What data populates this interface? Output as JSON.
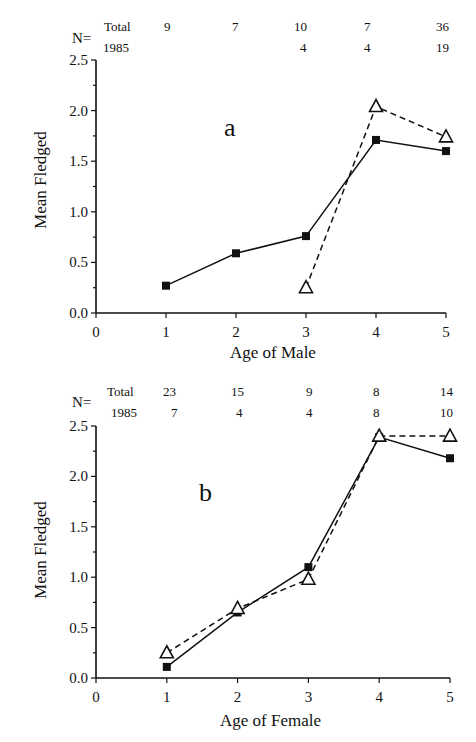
{
  "header": {
    "left_fragment": "",
    "center_fragment": "",
    "right_fragment": ""
  },
  "panels": [
    {
      "letter": "a",
      "n_table": {
        "label": "N=",
        "rows": [
          {
            "label": "Total",
            "values": [
              "9",
              "7",
              "10",
              "7",
              "36"
            ]
          },
          {
            "label": "1985",
            "values": [
              "",
              "",
              "4",
              "4",
              "19"
            ]
          }
        ]
      },
      "ylabel": "Mean Fledged",
      "xlabel": "Age of Male",
      "yticks": [
        "0.0",
        "0.5",
        "1.0",
        "1.5",
        "2.0",
        "2.5"
      ],
      "xticks": [
        "0",
        "1",
        "2",
        "3",
        "4",
        "5"
      ]
    },
    {
      "letter": "b",
      "n_table": {
        "label": "N=",
        "rows": [
          {
            "label": "Total",
            "values": [
              "23",
              "15",
              "9",
              "8",
              "14"
            ]
          },
          {
            "label": "1985",
            "values": [
              "7",
              "4",
              "4",
              "8",
              "10"
            ]
          }
        ]
      },
      "ylabel": "Mean Fledged",
      "xlabel": "Age of Female",
      "yticks": [
        "0.0",
        "0.5",
        "1.0",
        "1.5",
        "2.0",
        "2.5"
      ],
      "xticks": [
        "0",
        "1",
        "2",
        "3",
        "4",
        "5"
      ]
    }
  ],
  "chart_data": [
    {
      "type": "line",
      "title": "a",
      "xlabel": "Age of Male",
      "ylabel": "Mean Fledged",
      "xlim": [
        0,
        5
      ],
      "ylim": [
        0.0,
        2.5
      ],
      "grid": false,
      "x": [
        1,
        2,
        3,
        4,
        5
      ],
      "series": [
        {
          "name": "Total",
          "marker": "filled-square",
          "line": "solid",
          "x": [
            1,
            2,
            3,
            4,
            5
          ],
          "values": [
            0.27,
            0.59,
            0.76,
            1.71,
            1.6
          ]
        },
        {
          "name": "1985",
          "marker": "open-triangle",
          "line": "dashed",
          "x": [
            3,
            4,
            5
          ],
          "values": [
            0.25,
            2.04,
            1.74
          ]
        }
      ],
      "annotations": {
        "n_total": [
          9,
          7,
          10,
          7,
          36
        ],
        "n_1985": [
          null,
          null,
          4,
          4,
          19
        ]
      }
    },
    {
      "type": "line",
      "title": "b",
      "xlabel": "Age of Female",
      "ylabel": "Mean Fledged",
      "xlim": [
        0,
        5
      ],
      "ylim": [
        0.0,
        2.5
      ],
      "grid": false,
      "x": [
        1,
        2,
        3,
        4,
        5
      ],
      "series": [
        {
          "name": "Total",
          "marker": "filled-square",
          "line": "solid",
          "x": [
            1,
            2,
            3,
            4,
            5
          ],
          "values": [
            0.11,
            0.65,
            1.1,
            2.39,
            2.18
          ]
        },
        {
          "name": "1985",
          "marker": "open-triangle",
          "line": "dashed",
          "x": [
            1,
            2,
            3,
            4,
            5
          ],
          "values": [
            0.25,
            0.69,
            0.98,
            2.4,
            2.4
          ]
        }
      ],
      "annotations": {
        "n_total": [
          23,
          15,
          9,
          8,
          14
        ],
        "n_1985": [
          7,
          4,
          4,
          8,
          10
        ]
      }
    }
  ]
}
